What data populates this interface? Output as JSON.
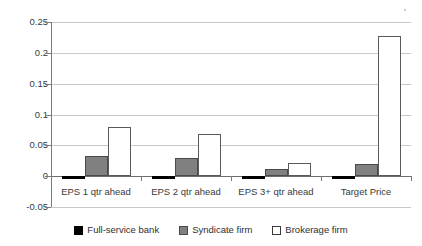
{
  "chart_data": {
    "type": "bar",
    "title": "",
    "subtitle": "",
    "xlabel": "",
    "ylabel": "",
    "categories": [
      "EPS 1 qtr ahead",
      "EPS 2 qtr ahead",
      "EPS 3+ qtr ahead",
      "Target Price"
    ],
    "series": [
      {
        "name": "Full-service bank",
        "color": "#000000",
        "values": [
          -0.005,
          -0.005,
          -0.004,
          -0.005
        ]
      },
      {
        "name": "Syndicate firm",
        "color": "#808080",
        "values": [
          0.033,
          0.03,
          0.012,
          0.02
        ]
      },
      {
        "name": "Brokerage firm",
        "color": "#ffffff",
        "values": [
          0.079,
          0.068,
          0.021,
          0.228
        ]
      }
    ],
    "ylim": [
      -0.05,
      0.25
    ],
    "ytick_values": [
      0.25,
      0.2,
      0.15,
      0.1,
      0.05,
      0,
      -0.05
    ],
    "ytick_labels": [
      "0.25",
      "0.2",
      "0.15",
      "0.1",
      "0.05",
      "0",
      "-0.05"
    ],
    "grid": "horizontal",
    "legend_position": "bottom",
    "zero_line": 0
  },
  "legend": {
    "items": [
      {
        "label": "Full-service bank",
        "swatch": "black-square-icon"
      },
      {
        "label": "Syndicate firm",
        "swatch": "gray-square-icon"
      },
      {
        "label": "Brokerage firm",
        "swatch": "white-square-icon"
      }
    ]
  }
}
